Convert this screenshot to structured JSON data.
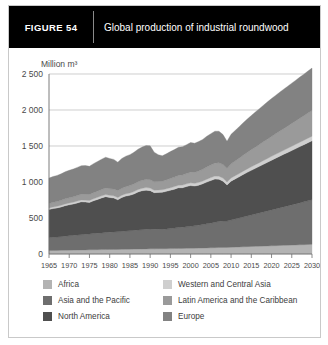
{
  "figure": {
    "tag": "FIGURE  54",
    "title": "Global production of industrial roundwood"
  },
  "chart_data": {
    "type": "area",
    "stacked": true,
    "title": "Global production of industrial roundwood",
    "xlabel": "",
    "ylabel": "Million m³",
    "unit_label": "Million m³",
    "xlim": [
      1965,
      2030
    ],
    "ylim": [
      0,
      2500
    ],
    "yticks": [
      0,
      500,
      1000,
      1500,
      2000,
      2500
    ],
    "ytick_labels": [
      "0",
      "500",
      "1 000",
      "1 500",
      "2 000",
      "2 500"
    ],
    "xticks": [
      1965,
      1970,
      1975,
      1980,
      1985,
      1990,
      1995,
      2000,
      2005,
      2010,
      2015,
      2020,
      2025,
      2030
    ],
    "xtick_labels": [
      "1965",
      "1970",
      "1975",
      "1980",
      "1985",
      "1990",
      "1995",
      "2000",
      "2005",
      "2010",
      "2015",
      "2020",
      "2025",
      "2030"
    ],
    "grid": true,
    "legend_position": "below",
    "colors": {
      "africa": "#b3b3b3",
      "asia_pacific": "#6e6e6e",
      "north_america": "#4f4f4f",
      "western_central_asia": "#cfcfcf",
      "latin_america_caribbean": "#9a9a9a",
      "europe": "#828282"
    },
    "x": [
      1965,
      1966,
      1967,
      1968,
      1969,
      1970,
      1971,
      1972,
      1973,
      1974,
      1975,
      1976,
      1977,
      1978,
      1979,
      1980,
      1981,
      1982,
      1983,
      1984,
      1985,
      1986,
      1987,
      1988,
      1989,
      1990,
      1991,
      1992,
      1993,
      1994,
      1995,
      1996,
      1997,
      1998,
      1999,
      2000,
      2001,
      2002,
      2003,
      2004,
      2005,
      2006,
      2007,
      2008,
      2009,
      2010,
      2011,
      2012,
      2013,
      2014,
      2015,
      2016,
      2017,
      2018,
      2019,
      2020,
      2021,
      2022,
      2023,
      2024,
      2025,
      2026,
      2027,
      2028,
      2029,
      2030
    ],
    "series": [
      {
        "name": "Africa",
        "key": "africa",
        "color": "#b3b3b3",
        "values": [
          48,
          49,
          50,
          51,
          52,
          53,
          54,
          55,
          56,
          57,
          58,
          59,
          60,
          61,
          62,
          63,
          64,
          64,
          65,
          66,
          67,
          68,
          69,
          70,
          71,
          72,
          72,
          73,
          73,
          74,
          75,
          76,
          77,
          78,
          79,
          80,
          81,
          82,
          83,
          85,
          86,
          88,
          90,
          91,
          92,
          94,
          96,
          98,
          100,
          102,
          104,
          106,
          108,
          110,
          112,
          114,
          116,
          118,
          120,
          122,
          124,
          126,
          128,
          130,
          132,
          134
        ]
      },
      {
        "name": "Asia and the Pacific",
        "key": "asia_pacific",
        "color": "#6e6e6e",
        "values": [
          178,
          182,
          186,
          190,
          195,
          200,
          204,
          208,
          212,
          216,
          220,
          224,
          228,
          232,
          236,
          240,
          243,
          245,
          248,
          252,
          256,
          260,
          264,
          268,
          272,
          276,
          272,
          270,
          268,
          272,
          278,
          284,
          290,
          294,
          298,
          304,
          310,
          318,
          326,
          334,
          342,
          352,
          362,
          368,
          366,
          378,
          390,
          402,
          414,
          426,
          438,
          450,
          462,
          474,
          486,
          498,
          510,
          522,
          534,
          546,
          558,
          570,
          582,
          594,
          606,
          618
        ]
      },
      {
        "name": "North America",
        "key": "north_america",
        "color": "#4f4f4f",
        "values": [
          392,
          400,
          404,
          412,
          424,
          430,
          436,
          446,
          456,
          448,
          438,
          456,
          470,
          486,
          498,
          482,
          470,
          444,
          472,
          486,
          492,
          506,
          528,
          540,
          544,
          532,
          508,
          512,
          516,
          524,
          532,
          540,
          552,
          548,
          560,
          566,
          552,
          556,
          566,
          580,
          592,
          600,
          586,
          552,
          500,
          540,
          556,
          572,
          590,
          606,
          620,
          634,
          648,
          662,
          676,
          690,
          704,
          716,
          730,
          742,
          756,
          768,
          782,
          794,
          808,
          820
        ]
      },
      {
        "name": "Western and Central Asia",
        "key": "western_central_asia",
        "color": "#cfcfcf",
        "values": [
          22,
          23,
          23,
          24,
          25,
          25,
          26,
          26,
          27,
          27,
          28,
          28,
          29,
          29,
          30,
          30,
          31,
          31,
          32,
          32,
          33,
          33,
          34,
          34,
          35,
          35,
          34,
          34,
          34,
          35,
          35,
          36,
          36,
          37,
          37,
          38,
          38,
          39,
          39,
          40,
          41,
          42,
          43,
          43,
          42,
          44,
          45,
          46,
          47,
          48,
          49,
          50,
          51,
          52,
          53,
          54,
          55,
          56,
          57,
          58,
          59,
          60,
          61,
          62,
          63,
          64
        ]
      },
      {
        "name": "Latin America and the Caribbean",
        "key": "latin_america_caribbean",
        "color": "#9a9a9a",
        "values": [
          62,
          64,
          66,
          68,
          70,
          72,
          74,
          76,
          78,
          80,
          82,
          84,
          86,
          88,
          90,
          92,
          94,
          94,
          96,
          99,
          102,
          105,
          108,
          111,
          114,
          117,
          116,
          118,
          120,
          124,
          128,
          132,
          136,
          140,
          144,
          148,
          152,
          157,
          162,
          168,
          174,
          180,
          186,
          188,
          186,
          196,
          204,
          212,
          220,
          228,
          236,
          244,
          252,
          260,
          268,
          276,
          284,
          292,
          300,
          308,
          316,
          324,
          332,
          340,
          348,
          356
        ]
      },
      {
        "name": "Europe",
        "key": "europe",
        "color": "#828282",
        "values": [
          352,
          358,
          362,
          368,
          376,
          382,
          386,
          392,
          398,
          400,
          392,
          404,
          412,
          420,
          428,
          420,
          412,
          398,
          414,
          424,
          430,
          440,
          452,
          462,
          470,
          470,
          412,
          372,
          352,
          362,
          374,
          382,
          392,
          394,
          400,
          412,
          406,
          410,
          416,
          428,
          436,
          444,
          438,
          416,
          380,
          410,
          424,
          438,
          452,
          464,
          476,
          488,
          498,
          508,
          518,
          526,
          534,
          542,
          548,
          554,
          560,
          566,
          572,
          578,
          584,
          590
        ]
      }
    ]
  },
  "legend": {
    "items": [
      {
        "label": "Africa",
        "color": "#b3b3b3"
      },
      {
        "label": "Western and Central Asia",
        "color": "#cfcfcf"
      },
      {
        "label": "Asia and the Pacific",
        "color": "#6e6e6e"
      },
      {
        "label": "Latin America and the Caribbean",
        "color": "#9a9a9a"
      },
      {
        "label": "North America",
        "color": "#4f4f4f"
      },
      {
        "label": "Europe",
        "color": "#828282"
      }
    ]
  }
}
